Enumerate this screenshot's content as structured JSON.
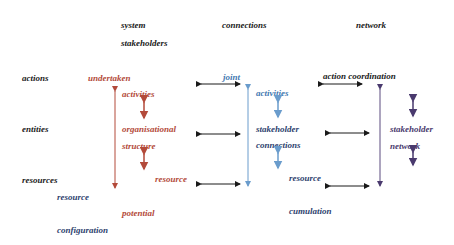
{
  "headers": {
    "system_line1": "system",
    "system_line2": "stakeholders",
    "connections": "connections",
    "network": "network"
  },
  "row_labels": {
    "actions": "actions",
    "entities": "entities",
    "resources": "resources",
    "resource_config_1": "resource",
    "resource_config_2": "configuration"
  },
  "system_column": {
    "undertaken": "undertaken",
    "activities": "activities",
    "organisational": "organisational",
    "structure": "structure",
    "resource": "resource",
    "potential": "potential"
  },
  "connections_column": {
    "joint": "joint",
    "activities": "activities",
    "stakeholder": "stakeholder",
    "connections": "connections",
    "resource": "resource",
    "cumulation": "cumulation"
  },
  "network_column": {
    "action_coordination": "action coordination",
    "stakeholder": "stakeholder",
    "network": "network"
  },
  "colors": {
    "system": "#b34a3a",
    "connections": "#3f78b0",
    "network": "#4a3a6e",
    "arrows": "#1a1a1a"
  }
}
